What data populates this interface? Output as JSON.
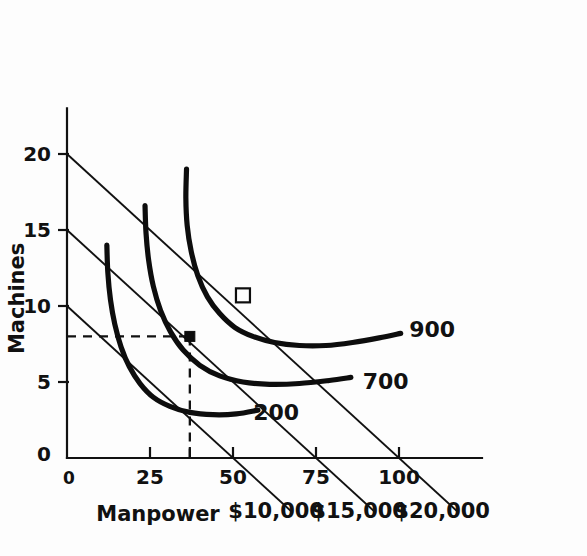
{
  "chart_data": {
    "type": "line",
    "title": "",
    "xlabel": "Manpower",
    "ylabel": "Machines",
    "xlim": [
      0,
      125
    ],
    "ylim": [
      0,
      23
    ],
    "grid": false,
    "legend_position": "inline-right",
    "x_ticks": [
      {
        "value": 0,
        "label": "0"
      },
      {
        "value": 25,
        "label": "25"
      },
      {
        "value": 50,
        "label": "50"
      },
      {
        "value": 75,
        "label": "75"
      },
      {
        "value": 100,
        "label": "100"
      }
    ],
    "y_ticks": [
      {
        "value": 0,
        "label": "0"
      },
      {
        "value": 5,
        "label": "5"
      },
      {
        "value": 10,
        "label": "10"
      },
      {
        "value": 15,
        "label": "15"
      },
      {
        "value": 20,
        "label": "20"
      }
    ],
    "series": [
      {
        "name": "200",
        "kind": "isoquant",
        "label": "200",
        "label_x": 63,
        "label_y": 3.0,
        "points": [
          [
            12.0,
            14.0
          ],
          [
            12.3,
            12.2
          ],
          [
            13.1,
            10.4
          ],
          [
            14.4,
            8.8
          ],
          [
            16.3,
            7.3
          ],
          [
            18.8,
            6.0
          ],
          [
            22.0,
            4.9
          ],
          [
            26.0,
            4.0
          ],
          [
            31.0,
            3.4
          ],
          [
            37.0,
            3.0
          ],
          [
            44.0,
            2.85
          ],
          [
            51.0,
            2.9
          ],
          [
            57.5,
            3.15
          ]
        ]
      },
      {
        "name": "700",
        "kind": "isoquant",
        "label": "700",
        "label_x": 96,
        "label_y": 5.05,
        "points": [
          [
            23.5,
            16.6
          ],
          [
            23.8,
            14.8
          ],
          [
            24.6,
            13.0
          ],
          [
            26.0,
            11.3
          ],
          [
            28.2,
            9.7
          ],
          [
            31.2,
            8.3
          ],
          [
            35.0,
            7.1
          ],
          [
            40.0,
            6.1
          ],
          [
            46.0,
            5.4
          ],
          [
            53.0,
            5.0
          ],
          [
            61.0,
            4.85
          ],
          [
            70.0,
            4.9
          ],
          [
            79.0,
            5.1
          ],
          [
            85.5,
            5.3
          ]
        ]
      },
      {
        "name": "900",
        "kind": "isoquant",
        "label": "900",
        "label_x": 110,
        "label_y": 8.5,
        "points": [
          [
            36.0,
            19.0
          ],
          [
            35.8,
            17.1
          ],
          [
            36.2,
            15.3
          ],
          [
            37.4,
            13.6
          ],
          [
            39.4,
            12.0
          ],
          [
            42.3,
            10.6
          ],
          [
            46.0,
            9.5
          ],
          [
            50.5,
            8.6
          ],
          [
            56.0,
            8.0
          ],
          [
            62.5,
            7.6
          ],
          [
            70.0,
            7.4
          ],
          [
            78.0,
            7.4
          ],
          [
            86.0,
            7.6
          ],
          [
            94.0,
            7.9
          ],
          [
            100.5,
            8.2
          ]
        ]
      }
    ],
    "isocost_lines": [
      {
        "label": "$10,000",
        "y_intercept": 10,
        "x_intercept": 50,
        "extend_to_x": 68,
        "label_x": 63,
        "label_y": -3.5
      },
      {
        "label": "$15,000",
        "y_intercept": 15,
        "x_intercept": 75,
        "extend_to_x": 93,
        "label_x": 88,
        "label_y": -3.5
      },
      {
        "label": "$20,000",
        "y_intercept": 20,
        "x_intercept": 100,
        "extend_to_x": 118,
        "label_x": 113,
        "label_y": -3.5
      }
    ],
    "markers": [
      {
        "name": "optimum-900-20000",
        "shape": "open-square",
        "x": 53.0,
        "y": 10.7
      },
      {
        "name": "optimum-700-15000",
        "shape": "filled-square",
        "x": 37.0,
        "y": 8.0
      }
    ],
    "guide_lines": [
      {
        "name": "horizontal-guide",
        "orientation": "horizontal",
        "from": [
          0,
          8.0
        ],
        "to": [
          37.0,
          8.0
        ]
      },
      {
        "name": "vertical-guide",
        "orientation": "vertical",
        "from": [
          37.0,
          8.0
        ],
        "to": [
          37.0,
          0
        ]
      }
    ],
    "guide_tick": {
      "x": 37.0,
      "label": ""
    },
    "origin_labels": {
      "y_axis_zero": "0",
      "x_axis_zero": "0"
    },
    "color": "#111111",
    "background": "#fdfdfd"
  }
}
